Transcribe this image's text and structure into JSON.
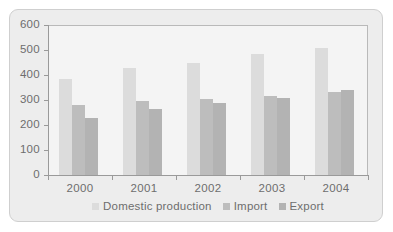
{
  "chart_data": {
    "type": "bar",
    "title": "",
    "subtitle": "",
    "xlabel": "",
    "ylabel": "",
    "categories": [
      "2000",
      "2001",
      "2002",
      "2003",
      "2004"
    ],
    "series": [
      {
        "name": "Domestic production",
        "color": "#dcdcdc",
        "values": [
          385,
          428,
          448,
          483,
          508
        ]
      },
      {
        "name": "Import",
        "color": "#bdbdbd",
        "values": [
          280,
          298,
          305,
          315,
          332
        ]
      },
      {
        "name": "Export",
        "color": "#b3b3b3",
        "values": [
          230,
          265,
          290,
          308,
          340
        ]
      }
    ],
    "ylim": [
      0,
      600
    ],
    "yticks": [
      0,
      100,
      200,
      300,
      400,
      500,
      600
    ],
    "ytick_labels": [
      "0",
      "100",
      "200",
      "300",
      "400",
      "500",
      "600"
    ],
    "grid": false,
    "legend_position": "bottom",
    "legend_entries": [
      "Domestic production",
      "Import",
      "Export"
    ]
  },
  "style": {
    "plot_background": "#f4f4f4",
    "panel_background": "#ededed",
    "panel_border": "#cfcfcf",
    "axis_color": "#9a9a9a",
    "frame_color": "#b9b9b9",
    "text_color": "#6e6e6e"
  }
}
